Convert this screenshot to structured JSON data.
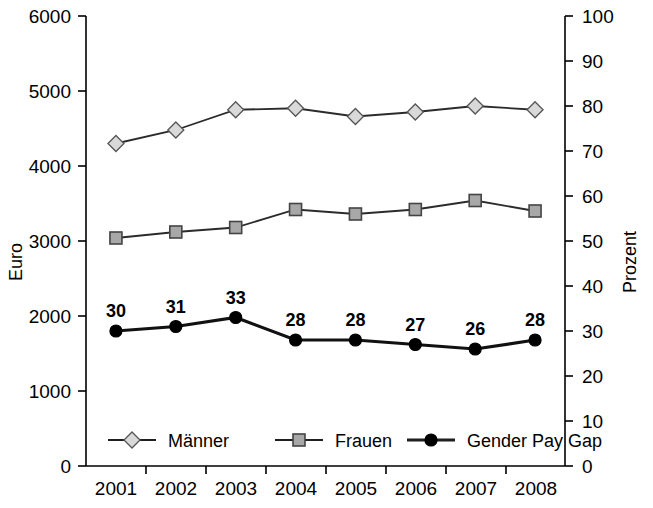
{
  "chart_data": {
    "type": "line",
    "title": "",
    "subtitle": "",
    "xlabel": "",
    "ylabel": "Euro",
    "y2label": "Prozent",
    "categories": [
      "2001",
      "2002",
      "2003",
      "2004",
      "2005",
      "2006",
      "2007",
      "2008"
    ],
    "x": [
      2001,
      2002,
      2003,
      2004,
      2005,
      2006,
      2007,
      2008
    ],
    "ylim": [
      0,
      6000
    ],
    "y2lim": [
      0,
      100
    ],
    "yticks": [
      "6000",
      "5000",
      "4000",
      "3000",
      "2000",
      "1000",
      "0"
    ],
    "ytick_values": [
      6000,
      5000,
      4000,
      3000,
      2000,
      1000,
      0
    ],
    "y2ticks": [
      "100",
      "90",
      "80",
      "70",
      "60",
      "50",
      "40",
      "30",
      "20",
      "10",
      "0"
    ],
    "y2tick_values": [
      100,
      90,
      80,
      70,
      60,
      50,
      40,
      30,
      20,
      10,
      0
    ],
    "grid": false,
    "legend_position": "bottom-inside",
    "series": [
      {
        "name": "Männer",
        "axis": "left",
        "unit": "Euro",
        "marker": "diamond",
        "marker_fill": "#d9d9d9",
        "marker_stroke": "#555555",
        "line_color": "#2b2b2b",
        "values": [
          4300,
          4480,
          4750,
          4770,
          4660,
          4720,
          4800,
          4750
        ],
        "labels": [
          "",
          "",
          "",
          "",
          "",
          "",
          "",
          ""
        ]
      },
      {
        "name": "Frauen",
        "axis": "left",
        "unit": "Euro",
        "marker": "square",
        "marker_fill": "#a8a8a8",
        "marker_stroke": "#444444",
        "line_color": "#2b2b2b",
        "values": [
          3040,
          3120,
          3180,
          3420,
          3360,
          3420,
          3540,
          3400
        ],
        "labels": [
          "",
          "",
          "",
          "",
          "",
          "",
          "",
          ""
        ]
      },
      {
        "name": "Gender Pay Gap",
        "axis": "right",
        "unit": "Prozent",
        "marker": "circle",
        "marker_fill": "#000000",
        "marker_stroke": "#000000",
        "line_color": "#111111",
        "values": [
          30,
          31,
          33,
          28,
          28,
          27,
          26,
          28
        ],
        "labels": [
          "30",
          "31",
          "33",
          "28",
          "28",
          "27",
          "26",
          "28"
        ]
      }
    ],
    "annotations": []
  },
  "legend": {
    "items": [
      {
        "label": "Männer",
        "marker": "diamond"
      },
      {
        "label": "Frauen",
        "marker": "square"
      },
      {
        "label": "Gender Pay Gap",
        "marker": "circle"
      }
    ]
  },
  "colors": {
    "axis": "#000000",
    "maenner_marker": "#d9d9d9",
    "frauen_marker": "#a8a8a8",
    "gap_marker": "#000000",
    "line": "#2b2b2b",
    "background": "#ffffff"
  }
}
